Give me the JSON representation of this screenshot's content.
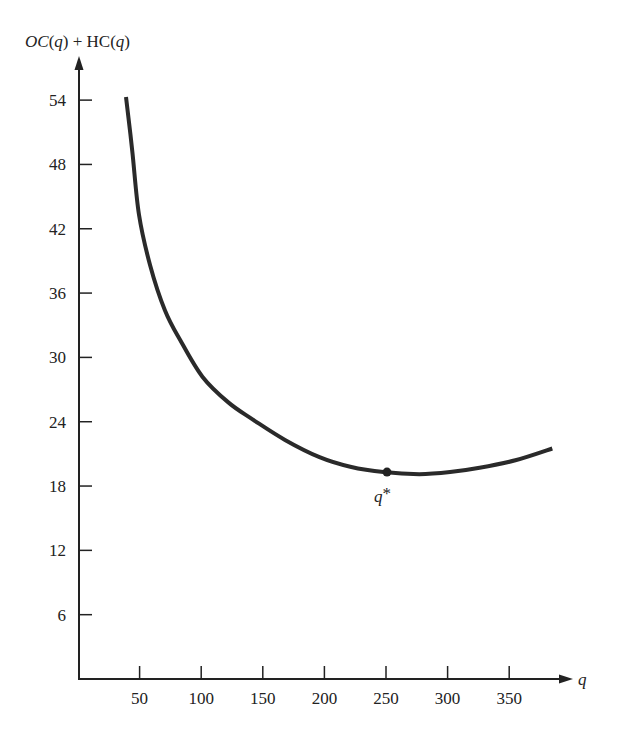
{
  "chart_data": {
    "type": "line",
    "title": "",
    "xlabel": "q",
    "ylabel_parts": [
      {
        "text": "OC",
        "italic": true
      },
      {
        "text": "(",
        "italic": false
      },
      {
        "text": "q",
        "italic": true
      },
      {
        "text": ") + HC(",
        "italic": false
      },
      {
        "text": "q",
        "italic": true
      },
      {
        "text": ")",
        "italic": false
      }
    ],
    "ylabel": "OC(q) + HC(q)",
    "xlim": [
      0,
      385
    ],
    "ylim": [
      0,
      56
    ],
    "x_ticks": [
      50,
      100,
      150,
      200,
      250,
      300,
      350
    ],
    "y_ticks": [
      6,
      12,
      18,
      24,
      30,
      36,
      42,
      48,
      54
    ],
    "grid": false,
    "legend": null,
    "series": [
      {
        "name": "OC(q) + HC(q)",
        "color": "#2a2a2a",
        "points": [
          [
            39,
            54.3
          ],
          [
            44,
            49.3
          ],
          [
            49.5,
            43.3
          ],
          [
            58.5,
            38.6
          ],
          [
            70.5,
            34.4
          ],
          [
            83,
            31.6
          ],
          [
            101,
            28.2
          ],
          [
            122,
            25.8
          ],
          [
            142,
            24.2
          ],
          [
            168,
            22.3
          ],
          [
            196,
            20.7
          ],
          [
            221,
            19.8
          ],
          [
            248,
            19.3
          ],
          [
            277,
            19.1
          ],
          [
            302,
            19.3
          ],
          [
            326,
            19.7
          ],
          [
            355,
            20.4
          ],
          [
            385,
            21.5
          ]
        ]
      }
    ],
    "annotations": [
      {
        "label": "q*",
        "x": 250,
        "y": 19.3,
        "marker": "dot"
      }
    ]
  },
  "labels": {
    "y_axis_title": "OC(q) + HC(q)",
    "x_axis_title": "q",
    "optimum_label": "q*"
  }
}
